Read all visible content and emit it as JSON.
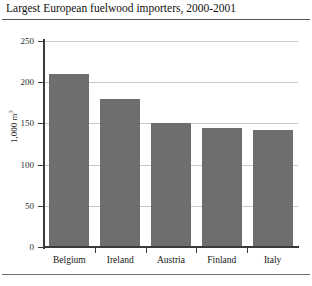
{
  "chart_data": {
    "type": "bar",
    "title": "Largest European fuelwood importers, 2000-2001",
    "categories": [
      "Belgium",
      "Ireland",
      "Austria",
      "Finland",
      "Italy"
    ],
    "values": [
      210,
      180,
      150,
      145,
      142
    ],
    "xlabel": "",
    "ylabel": "1,000 m",
    "ylabel_superscript": "3",
    "ylim": [
      0,
      250
    ],
    "ytick_labels": [
      "0",
      "50",
      "100",
      "150",
      "200",
      "250"
    ],
    "ytick_values": [
      0,
      50,
      100,
      150,
      200,
      250
    ],
    "grid": true,
    "legend": false,
    "bar_color": "#6e6e6e",
    "axis_color": "#3a3a3a",
    "gridline_color": "#c9c9c9"
  },
  "footer": {
    "note": ""
  }
}
